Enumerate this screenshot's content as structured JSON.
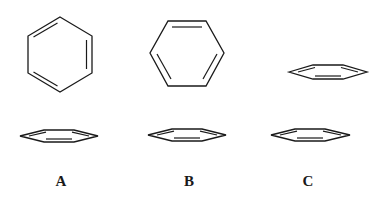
{
  "figure": {
    "panels": [
      {
        "label": "A",
        "top_view": "pointy-top hexagon",
        "side_view": "single flat ring"
      },
      {
        "label": "B",
        "top_view": "flat-top hexagon",
        "side_view": "single flat ring"
      },
      {
        "label": "C",
        "top_view": "none",
        "side_view": "two stacked flat rings (parallel-displaced)"
      }
    ]
  },
  "labels": {
    "a": "A",
    "b": "B",
    "c": "C"
  },
  "colors": {
    "stroke": "#1a1a1a",
    "background": "#ffffff"
  }
}
